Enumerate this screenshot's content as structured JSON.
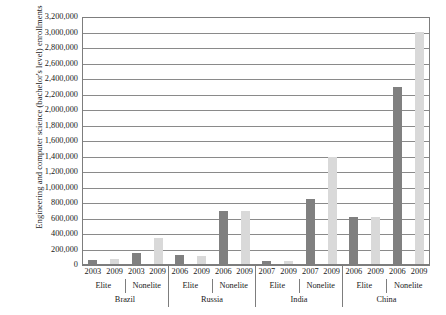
{
  "chart_data": {
    "type": "bar",
    "title": "",
    "xlabel": "",
    "ylabel": "Engineering and computer science (bachelor's level) enrollments",
    "ylim": [
      0,
      3200000
    ],
    "ytick_step": 200000,
    "grid": true,
    "legend_position": "none",
    "ytick_labels": [
      "3,200,000",
      "3,000,000",
      "2,800,000",
      "2,600,000",
      "2,400,000",
      "2,200,000",
      "2,000,000",
      "1,800,000",
      "1,600,000",
      "1,400,000",
      "1,200,000",
      "1,000,000",
      "800,000",
      "600,000",
      "400,000",
      "200,000",
      "0"
    ],
    "colors": {
      "early_year_bar": "#808080",
      "later_year_bar": "#d9d9d9",
      "axis": "#7d7d7d"
    },
    "groups": [
      {
        "country": "Brazil",
        "tiers": [
          {
            "tier": "Elite",
            "points": [
              {
                "year": "2003",
                "value": 62000
              },
              {
                "year": "2009",
                "value": 82000
              }
            ]
          },
          {
            "tier": "Nonelite",
            "points": [
              {
                "year": "2003",
                "value": 155000
              },
              {
                "year": "2009",
                "value": 350000
              }
            ]
          }
        ]
      },
      {
        "country": "Russia",
        "tiers": [
          {
            "tier": "Elite",
            "points": [
              {
                "year": "2006",
                "value": 130000
              },
              {
                "year": "2009",
                "value": 118000
              }
            ]
          },
          {
            "tier": "Nonelite",
            "points": [
              {
                "year": "2006",
                "value": 700000
              },
              {
                "year": "2009",
                "value": 700000
              }
            ]
          }
        ]
      },
      {
        "country": "India",
        "tiers": [
          {
            "tier": "Elite",
            "points": [
              {
                "year": "2007",
                "value": 55000
              },
              {
                "year": "2009",
                "value": 50000
              }
            ]
          },
          {
            "tier": "Nonelite",
            "points": [
              {
                "year": "2007",
                "value": 850000
              },
              {
                "year": "2009",
                "value": 1400000
              }
            ]
          }
        ]
      },
      {
        "country": "China",
        "tiers": [
          {
            "tier": "Elite",
            "points": [
              {
                "year": "2006",
                "value": 620000
              },
              {
                "year": "2009",
                "value": 625000
              }
            ]
          },
          {
            "tier": "Nonelite",
            "points": [
              {
                "year": "2006",
                "value": 2300000
              },
              {
                "year": "2009",
                "value": 3010000
              }
            ]
          }
        ]
      }
    ]
  }
}
